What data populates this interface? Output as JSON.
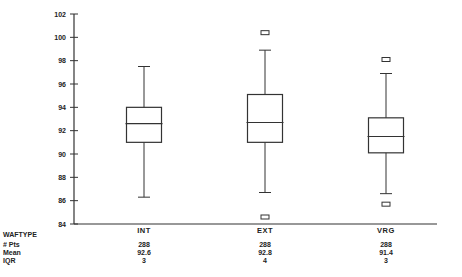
{
  "chart_data": {
    "type": "box",
    "title": "",
    "xlabel": "WAFTYPE",
    "ylabel": "",
    "ylim": [
      84,
      102
    ],
    "yticks": [
      102,
      100,
      98,
      96,
      94,
      92,
      90,
      88,
      86,
      84
    ],
    "categories": [
      "INT",
      "EXT",
      "VRG"
    ],
    "series": [
      {
        "name": "INT",
        "whisker_high": 97.5,
        "q3": 94.0,
        "median": 92.6,
        "q1": 91.0,
        "whisker_low": 86.3,
        "outliers": []
      },
      {
        "name": "EXT",
        "whisker_high": 98.9,
        "q3": 95.1,
        "median": 92.7,
        "q1": 91.0,
        "whisker_low": 86.7,
        "outliers": [
          100.4,
          84.6
        ]
      },
      {
        "name": "VRG",
        "whisker_high": 96.9,
        "q3": 93.1,
        "median": 91.5,
        "q1": 90.1,
        "whisker_low": 86.6,
        "outliers": [
          98.1,
          85.7
        ]
      }
    ],
    "stats_table": {
      "row_labels": [
        "# Pts",
        "Mean",
        "IQR"
      ],
      "values": {
        "INT": [
          "288",
          "92.6",
          "3"
        ],
        "EXT": [
          "288",
          "92.8",
          "4"
        ],
        "VRG": [
          "288",
          "91.4",
          "3"
        ]
      }
    },
    "grid": false,
    "legend": "none"
  },
  "labels": {
    "xaxis_title": "WAFTYPE",
    "row_pts": "# Pts",
    "row_mean": "Mean",
    "row_iqr": "IQR"
  }
}
